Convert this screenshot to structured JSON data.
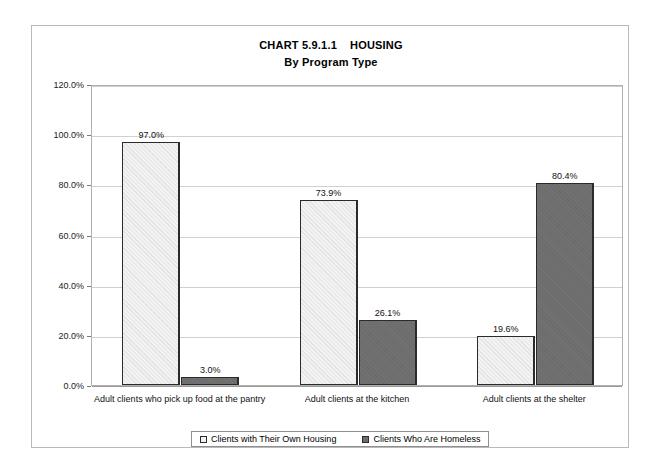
{
  "chart_data": {
    "type": "bar",
    "title": "CHART 5.9.1.1    HOUSING",
    "subtitle": "By Program Type",
    "xlabel": "Housing",
    "ylabel": "Percentage of Clients",
    "ylim": [
      0,
      120
    ],
    "ytick_labels": [
      "120.0%",
      "100.0%",
      "80.0%",
      "60.0%",
      "40.0%",
      "20.0%",
      "0.0%"
    ],
    "ytick_values": [
      120,
      100,
      80,
      60,
      40,
      20,
      0
    ],
    "grid": true,
    "legend_position": "bottom",
    "categories": [
      "Adult clients who pick up food at the pantry",
      "Adult clients at the kitchen",
      "Adult clients at the shelter"
    ],
    "series": [
      {
        "name": "Clients with Their Own Housing",
        "color": "#f2f2f2",
        "values": [
          97.0,
          73.9,
          19.6
        ],
        "labels": [
          "97.0%",
          "73.9%",
          "19.6%"
        ]
      },
      {
        "name": "Clients Who Are Homeless",
        "color": "#6d6d6d",
        "values": [
          3.0,
          26.1,
          80.4
        ],
        "labels": [
          "3.0%",
          "26.1%",
          "80.4%"
        ]
      }
    ]
  },
  "legend": {
    "items": [
      {
        "label": "Clients with Their Own Housing",
        "swatch": "light"
      },
      {
        "label": "Clients Who Are Homeless",
        "swatch": "dark"
      }
    ]
  }
}
